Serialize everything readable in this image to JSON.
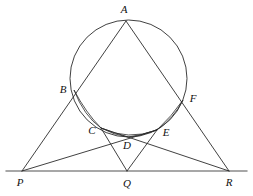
{
  "figure": {
    "kind": "euclidean-geometry-diagram",
    "width": 253,
    "height": 196,
    "background_color": "#ffffff",
    "line_color": "#2b2b2b",
    "baseline_color": "#8a8a8a",
    "label_color": "#111111"
  },
  "points": [
    {
      "id": "A",
      "label": "A",
      "x": 126,
      "y": 21,
      "label_x": 124,
      "label_y": 9
    },
    {
      "id": "B",
      "label": "B",
      "x": 74,
      "y": 90,
      "label_x": 63,
      "label_y": 89
    },
    {
      "id": "C",
      "label": "C",
      "x": 101,
      "y": 128,
      "label_x": 92,
      "label_y": 130
    },
    {
      "id": "D",
      "label": "D",
      "x": 128,
      "y": 137,
      "label_x": 127,
      "label_y": 145
    },
    {
      "id": "E",
      "label": "E",
      "x": 157,
      "y": 130,
      "label_x": 166,
      "label_y": 132
    },
    {
      "id": "F",
      "label": "F",
      "x": 183,
      "y": 100,
      "label_x": 193,
      "label_y": 98
    },
    {
      "id": "P",
      "label": "P",
      "x": 22,
      "y": 171,
      "label_x": 20,
      "label_y": 182
    },
    {
      "id": "Q",
      "label": "Q",
      "x": 127,
      "y": 171,
      "label_x": 127,
      "label_y": 183
    },
    {
      "id": "R",
      "label": "R",
      "x": 229,
      "y": 171,
      "label_x": 229,
      "label_y": 182
    }
  ],
  "circle": {
    "id": "main-circle",
    "center_x": 128.5,
    "center_y": 78.5,
    "radius": 58.5
  },
  "segments": [
    {
      "id": "PA",
      "from": "P",
      "to": "A",
      "note": "left side of triangle through B"
    },
    {
      "id": "RA",
      "from": "R",
      "to": "A",
      "note": "right side of triangle through F"
    },
    {
      "id": "PE",
      "from": "P",
      "to": "E",
      "note": "cevian from P through D to E"
    },
    {
      "id": "RC",
      "from": "R",
      "to": "C",
      "note": "cevian from R through D to C"
    },
    {
      "id": "QC",
      "from": "Q",
      "to": "C",
      "note": "segment from Q up to C"
    },
    {
      "id": "QE",
      "from": "Q",
      "to": "E",
      "note": "segment from Q up to E"
    }
  ],
  "baseline": {
    "id": "PR-baseline",
    "x1": 6,
    "y1": 171,
    "x2": 247,
    "y2": 171,
    "label": "line through P, Q, R"
  },
  "arcs": [
    {
      "id": "arc-BC",
      "from": "B",
      "to": "C",
      "note": "small arc bulging outward left-lower"
    },
    {
      "id": "arc-CD",
      "from": "C",
      "to": "D",
      "note": "small arc near bottom left"
    },
    {
      "id": "arc-DE",
      "from": "D",
      "to": "E",
      "note": "small arc near bottom right"
    },
    {
      "id": "arc-EF",
      "from": "E",
      "to": "F",
      "note": "small arc bulging outward right-lower"
    }
  ]
}
